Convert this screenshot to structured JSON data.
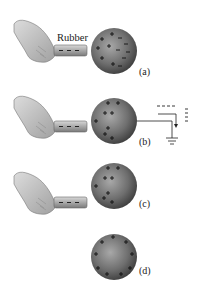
{
  "diagram": {
    "rod_label": "Rubber",
    "panels": [
      {
        "id": "a",
        "label": "(a)",
        "description": "Negatively charged rubber rod near neutral sphere; charges separate: + near rod, − on far side",
        "rod_present": true,
        "ground": false
      },
      {
        "id": "b",
        "label": "(b)",
        "description": "Sphere grounded by wire; electrons flow to ground",
        "rod_present": true,
        "ground": true
      },
      {
        "id": "c",
        "label": "(c)",
        "description": "Ground removed; sphere left with excess positive charge concentrated near rod",
        "rod_present": true,
        "ground": false
      },
      {
        "id": "d",
        "label": "(d)",
        "description": "Rod removed; positive charge distributes uniformly over sphere surface",
        "rod_present": false,
        "ground": false
      }
    ],
    "colors": {
      "sphere_light": "#9a9a9a",
      "sphere_dark": "#3c3c3c",
      "hand": "#c8c8c8",
      "rod": "#b0b0b0",
      "ink": "#222222"
    }
  }
}
